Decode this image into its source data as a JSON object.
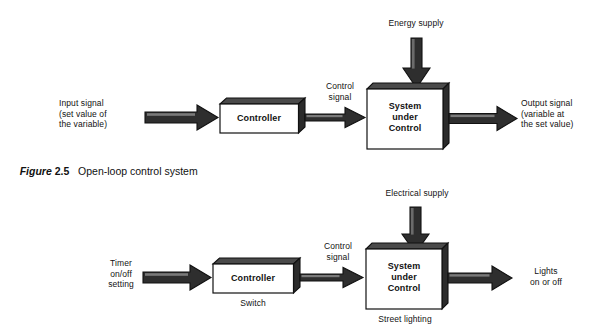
{
  "figure": {
    "caption_word": "Figure",
    "caption_number": "2.5",
    "caption_title": "Open-loop control system"
  },
  "colors": {
    "stroke": "#111111",
    "box_fill": "#ffffff",
    "box_top_face": "#4a4a4a",
    "box_side_face": "#2b2b2b",
    "arrow_fill": "#2e2e2e",
    "arrow_highlight": "#6e6e6e",
    "background": "#ffffff",
    "text": "#121212"
  },
  "diagrams": [
    {
      "id": "open-loop-generic",
      "input_label": "Input signal\n(set value of\nthe variable)",
      "input_label_lines": [
        "Input signal",
        "(set value of",
        "the variable)"
      ],
      "controller_label": "Controller",
      "controller_sublabel": "",
      "control_signal_label": "Control\nsignal",
      "control_signal_lines": [
        "Control",
        "signal"
      ],
      "supply_label": "Energy supply",
      "system_label": "System\nunder\nControl",
      "system_label_lines": [
        "System",
        "under",
        "Control"
      ],
      "system_sublabel": "",
      "output_label": "Output signal\n(variable at\nthe set value)",
      "output_label_lines": [
        "Output signal",
        "(variable at",
        "the set value)"
      ]
    },
    {
      "id": "open-loop-street-lighting",
      "input_label": "Timer\non/off\nsetting",
      "input_label_lines": [
        "Timer",
        "on/off",
        "setting"
      ],
      "controller_label": "Controller",
      "controller_sublabel": "Switch",
      "control_signal_label": "Control\nsignal",
      "control_signal_lines": [
        "Control",
        "signal"
      ],
      "supply_label": "Electrical supply",
      "system_label": "System\nunder\nControl",
      "system_label_lines": [
        "System",
        "under",
        "Control"
      ],
      "system_sublabel": "Street lighting",
      "output_label": "Lights\non or off",
      "output_label_lines": [
        "Lights",
        "on or off"
      ]
    }
  ]
}
